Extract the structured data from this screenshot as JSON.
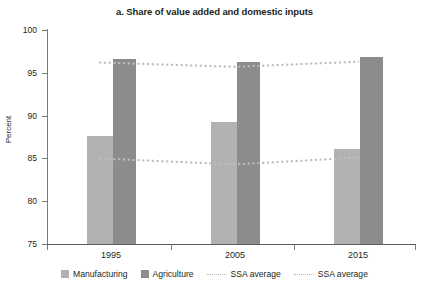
{
  "chart_data": {
    "type": "bar",
    "title": "a. Share of value added and domestic inputs",
    "xlabel": "",
    "ylabel": "Percent",
    "ylim": [
      75,
      100
    ],
    "yticks": [
      75,
      80,
      85,
      90,
      95,
      100
    ],
    "grid": false,
    "legend_position": "bottom",
    "categories": [
      "1995",
      "2005",
      "2015"
    ],
    "series": [
      {
        "name": "Manufacturing",
        "type": "bar",
        "color": "#b2b2b2",
        "values": [
          87.6,
          89.3,
          86.1
        ]
      },
      {
        "name": "Agriculture",
        "type": "bar",
        "color": "#8c8c8c",
        "values": [
          96.6,
          96.3,
          96.8
        ]
      },
      {
        "name": "SSA average",
        "type": "line",
        "style": "dotted",
        "color": "#b9b9b9",
        "values": [
          96.2,
          95.7,
          96.3
        ]
      },
      {
        "name": "SSA average",
        "type": "line",
        "style": "dotted",
        "color": "#b9b9b9",
        "values": [
          85.0,
          84.3,
          85.1
        ]
      }
    ]
  },
  "title": "a. Share of value added and domestic inputs",
  "axes": {
    "y_title": "Percent",
    "y_ticks": [
      "100",
      "95",
      "90",
      "85",
      "80",
      "75"
    ],
    "x_ticks": [
      "1995",
      "2005",
      "2015"
    ]
  },
  "legend": {
    "items": [
      {
        "label": "Manufacturing",
        "kind": "swatch-light"
      },
      {
        "label": "Agriculture",
        "kind": "swatch-dark"
      },
      {
        "label": "SSA average",
        "kind": "dotted-line"
      },
      {
        "label": "SSA average",
        "kind": "dotted-line"
      }
    ]
  }
}
